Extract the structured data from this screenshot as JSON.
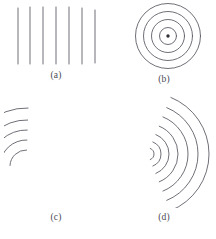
{
  "figure": {
    "type": "wavefront-diagram-grid",
    "background_color": "#ffffff",
    "stroke_color": "#55555f",
    "label_color": "#4a4a55",
    "width": 216,
    "height": 239
  },
  "panels": [
    {
      "id": "a",
      "label": "(a)",
      "name": "plane-wavefronts",
      "wavefront_shape": "straight-lines",
      "count": 7,
      "orientation": "vertical",
      "lines": [
        {
          "x": 14,
          "y1": 6,
          "y2": 62
        },
        {
          "x": 26,
          "y1": 5,
          "y2": 62
        },
        {
          "x": 39,
          "y1": 5,
          "y2": 62
        },
        {
          "x": 52,
          "y1": 5,
          "y2": 62
        },
        {
          "x": 65,
          "y1": 5,
          "y2": 62
        },
        {
          "x": 78,
          "y1": 6,
          "y2": 62
        },
        {
          "x": 91,
          "y1": 8,
          "y2": 61
        }
      ]
    },
    {
      "id": "b",
      "label": "(b)",
      "name": "circular-wavefronts",
      "wavefront_shape": "full-circles",
      "count": 4,
      "center": {
        "x": 56,
        "y": 34
      },
      "radii": [
        8.5,
        16.5,
        24.5,
        32.5
      ],
      "source_dot": {
        "x": 56,
        "y": 34,
        "r": 1.7
      }
    },
    {
      "id": "c",
      "label": "(c)",
      "name": "curved-wavefronts-corner",
      "wavefront_shape": "arcs",
      "count": 5,
      "center": {
        "x": 22,
        "y": 70
      },
      "radii": [
        16,
        26,
        36,
        46,
        58
      ],
      "arc_start_deg": 182,
      "arc_end_deg": 272
    },
    {
      "id": "d",
      "label": "(d)",
      "name": "expanding-circular-wavefronts",
      "wavefront_shape": "arcs",
      "count": 7,
      "center": {
        "x": 36,
        "y": 58
      },
      "radii": [
        6,
        13,
        21,
        30,
        40,
        50,
        61
      ],
      "arc_start_deg": -68,
      "arc_end_deg": 68
    }
  ]
}
